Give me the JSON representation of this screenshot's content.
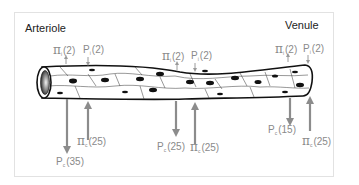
{
  "diagram": {
    "left_title": "Arteriole",
    "right_title": "Venule",
    "colors": {
      "arrow": "#8c8c8c",
      "label": "#8a8a8a",
      "vessel_outline": "#111111",
      "nucleus": "#111111",
      "frame": "#e2e2e2"
    },
    "labels": {
      "arteriole_top": {
        "pi_i": {
          "symbol": "π",
          "sub": "i",
          "value": "(2)"
        },
        "p_i": {
          "symbol": "P",
          "sub": "i",
          "value": "(2)"
        }
      },
      "middle_top": {
        "pi_i": {
          "symbol": "π",
          "sub": "i",
          "value": "(2)"
        },
        "p_i": {
          "symbol": "P",
          "sub": "i",
          "value": "(2)"
        }
      },
      "venule_top": {
        "pi_i": {
          "symbol": "π",
          "sub": "i",
          "value": "(2)"
        },
        "p_i": {
          "symbol": "P",
          "sub": "i",
          "value": "(2)"
        }
      },
      "arteriole_bottom": {
        "p_c": {
          "symbol": "P",
          "sub": "c",
          "value": "(35)"
        },
        "pi_c": {
          "symbol": "π",
          "sub": "c",
          "value": "(25)"
        }
      },
      "middle_bottom": {
        "p_c": {
          "symbol": "P",
          "sub": "c",
          "value": "(25)"
        },
        "pi_c": {
          "symbol": "π",
          "sub": "c",
          "value": "(25)"
        }
      },
      "venule_bottom": {
        "p_c": {
          "symbol": "P",
          "sub": "c",
          "value": "(15)"
        },
        "pi_c": {
          "symbol": "π",
          "sub": "c",
          "value": "(25)"
        }
      }
    }
  }
}
